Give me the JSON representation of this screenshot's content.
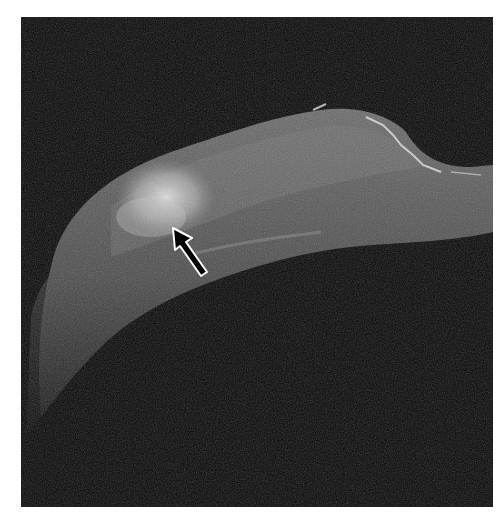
{
  "figure": {
    "kind": "MRI image",
    "colors": {
      "background": "#ffffff",
      "image_background": "#050505",
      "tissue": "#5a5a5a",
      "lesion": "#d8d8d8",
      "arrow_fill": "#000000",
      "arrow_outline": "#ffffff"
    },
    "annotations": [
      {
        "type": "arrow",
        "name": "lesion-pointer-arrow",
        "tip": [
          173,
          228
        ],
        "tail": [
          203,
          275
        ]
      }
    ]
  }
}
